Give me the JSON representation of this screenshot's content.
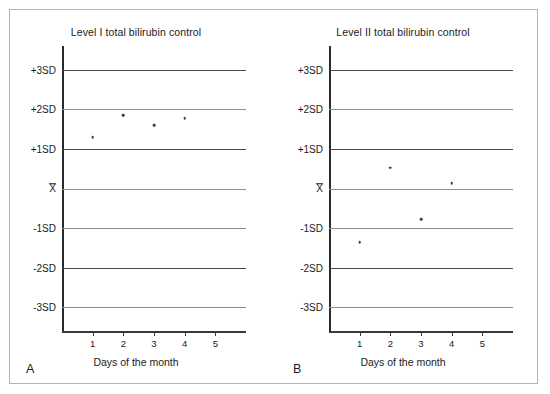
{
  "figure": {
    "background_color": "#ffffff",
    "border_color": "#b3b3b3",
    "axis_color": "#2a2a2a",
    "gridline_color": "#4a4a4a",
    "point_color": "#3d3d3d"
  },
  "panels": [
    {
      "letter": "A",
      "title": "Level I total bilirubin control",
      "x_axis_title": "Days of the month"
    },
    {
      "letter": "B",
      "title": "Level II total bilirubin control",
      "x_axis_title": "Days of the month"
    }
  ],
  "y_axis": {
    "labels": [
      "+3SD",
      "+2SD",
      "+1SD",
      "X",
      "-1SD",
      "-2SD",
      "-3SD"
    ],
    "mean_label": "X"
  },
  "x_axis": {
    "ticks": [
      "1",
      "2",
      "3",
      "4",
      "5"
    ]
  },
  "chart_data": [
    {
      "type": "scatter",
      "title": "Level I total bilirubin control",
      "panel": "A",
      "xlabel": "Days of the month",
      "ylabel": "",
      "xlim": [
        0,
        6
      ],
      "ylim": [
        -3.6,
        3.6
      ],
      "grid": true,
      "gridlines_y": [
        3,
        2,
        1,
        0,
        -1,
        -2,
        -3
      ],
      "ytick_labels": [
        "+3SD",
        "+2SD",
        "+1SD",
        "X",
        "-1SD",
        "-2SD",
        "-3SD"
      ],
      "xtick_labels": [
        "1",
        "2",
        "3",
        "4",
        "5"
      ],
      "legend": null,
      "x": [
        1,
        2,
        3,
        4
      ],
      "y": [
        1.3,
        1.85,
        1.6,
        1.78
      ],
      "series": [
        {
          "name": "Level I total bilirubin control",
          "x": [
            1,
            2,
            3,
            4
          ],
          "y": [
            1.3,
            1.85,
            1.6,
            1.78
          ]
        }
      ]
    },
    {
      "type": "scatter",
      "title": "Level II total bilirubin control",
      "panel": "B",
      "xlabel": "Days of the month",
      "ylabel": "",
      "xlim": [
        0,
        6
      ],
      "ylim": [
        -3.6,
        3.6
      ],
      "grid": true,
      "gridlines_y": [
        3,
        2,
        1,
        0,
        -1,
        -2,
        -3
      ],
      "ytick_labels": [
        "+3SD",
        "+2SD",
        "+1SD",
        "X",
        "-1SD",
        "-2SD",
        "-3SD"
      ],
      "xtick_labels": [
        "1",
        "2",
        "3",
        "4",
        "5"
      ],
      "legend": null,
      "x": [
        1,
        2,
        3,
        4
      ],
      "y": [
        -1.35,
        0.53,
        -0.78,
        0.14
      ],
      "series": [
        {
          "name": "Level II total bilirubin control",
          "x": [
            1,
            2,
            3,
            4
          ],
          "y": [
            -1.35,
            0.53,
            -0.78,
            0.14
          ]
        }
      ]
    }
  ]
}
